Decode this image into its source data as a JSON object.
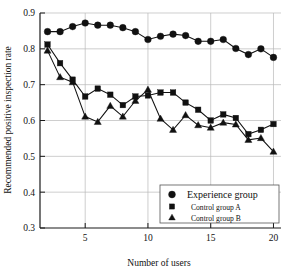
{
  "chart_data": {
    "type": "line",
    "title": "",
    "xlabel": "Number of users",
    "ylabel": "Recommended positive inspection rate",
    "xlim": [
      1.4,
      20.6
    ],
    "ylim": [
      0.3,
      0.9
    ],
    "xticks": [
      5,
      10,
      15,
      20
    ],
    "xtick_labels": [
      "5",
      "10",
      "15",
      "20"
    ],
    "yticks": [
      0.3,
      0.4,
      0.5,
      0.6,
      0.7,
      0.8,
      0.9
    ],
    "ytick_labels": [
      "0.3",
      "0.4",
      "0.5",
      "0.6",
      "0.7",
      "0.8",
      "0.9"
    ],
    "grid": true,
    "legend_position": "lower-right",
    "x": [
      2,
      3,
      4,
      5,
      6,
      7,
      8,
      9,
      10,
      11,
      12,
      13,
      14,
      15,
      16,
      17,
      18,
      19,
      20
    ],
    "series": [
      {
        "name": "Experience group",
        "marker": "circle",
        "values": [
          0.848,
          0.848,
          0.862,
          0.872,
          0.866,
          0.866,
          0.859,
          0.848,
          0.826,
          0.835,
          0.841,
          0.837,
          0.821,
          0.821,
          0.826,
          0.801,
          0.784,
          0.8,
          0.776
        ]
      },
      {
        "name": "Control group A",
        "marker": "square",
        "values": [
          0.812,
          0.76,
          0.714,
          0.667,
          0.689,
          0.672,
          0.643,
          0.667,
          0.67,
          0.678,
          0.678,
          0.65,
          0.63,
          0.6,
          0.617,
          0.607,
          0.562,
          0.574,
          0.59
        ]
      },
      {
        "name": "Control group B",
        "marker": "triangle",
        "values": [
          0.795,
          0.721,
          0.707,
          0.611,
          0.596,
          0.641,
          0.611,
          0.655,
          0.686,
          0.605,
          0.574,
          0.615,
          0.587,
          0.58,
          0.594,
          0.589,
          0.546,
          0.551,
          0.513
        ]
      }
    ],
    "legend": [
      {
        "label": "Experience group",
        "marker": "circle"
      },
      {
        "label": "Control group A",
        "marker": "square"
      },
      {
        "label": "Control group B",
        "marker": "triangle"
      }
    ],
    "colors": {
      "ink": "#111111",
      "grid": "#b9b9b9",
      "background": "#ffffff"
    }
  }
}
